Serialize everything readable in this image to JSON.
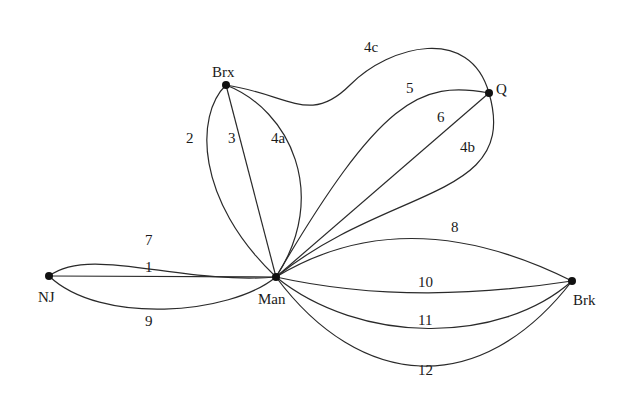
{
  "diagram": {
    "type": "multigraph",
    "nodes": [
      {
        "id": "NJ",
        "label": "NJ"
      },
      {
        "id": "Man",
        "label": "Man"
      },
      {
        "id": "Brx",
        "label": "Brx"
      },
      {
        "id": "Q",
        "label": "Q"
      },
      {
        "id": "Brk",
        "label": "Brk"
      }
    ],
    "edges": [
      {
        "label": "1",
        "from": "NJ",
        "to": "Man"
      },
      {
        "label": "7",
        "from": "NJ",
        "to": "Man"
      },
      {
        "label": "9",
        "from": "NJ",
        "to": "Man"
      },
      {
        "label": "2",
        "from": "Brx",
        "to": "Man"
      },
      {
        "label": "3",
        "from": "Brx",
        "to": "Man"
      },
      {
        "label": "4a",
        "from": "Brx",
        "to": "Man"
      },
      {
        "label": "4c",
        "from": "Brx",
        "to": "Q"
      },
      {
        "label": "4b",
        "from": "Q",
        "to": "Man"
      },
      {
        "label": "5",
        "from": "Q",
        "to": "Man"
      },
      {
        "label": "6",
        "from": "Q",
        "to": "Man"
      },
      {
        "label": "8",
        "from": "Man",
        "to": "Brk"
      },
      {
        "label": "10",
        "from": "Man",
        "to": "Brk"
      },
      {
        "label": "11",
        "from": "Man",
        "to": "Brk"
      },
      {
        "label": "12",
        "from": "Man",
        "to": "Brk"
      }
    ]
  },
  "labels": {
    "nodes": {
      "nj": "NJ",
      "man": "Man",
      "brx": "Brx",
      "q": "Q",
      "brk": "Brk"
    },
    "edges": {
      "e1": "1",
      "e2": "2",
      "e3": "3",
      "e4a": "4a",
      "e4b": "4b",
      "e4c": "4c",
      "e5": "5",
      "e6": "6",
      "e7": "7",
      "e8": "8",
      "e9": "9",
      "e10": "10",
      "e11": "11",
      "e12": "12"
    }
  }
}
